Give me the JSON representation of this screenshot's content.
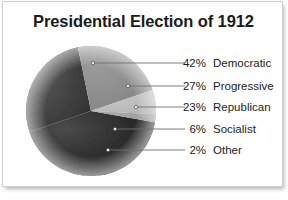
{
  "chart_data": {
    "type": "pie",
    "title": "Presidential Election of 1912",
    "categories": [
      "Democratic",
      "Progressive",
      "Republican",
      "Socialist",
      "Other"
    ],
    "values": [
      42,
      27,
      23,
      6,
      2
    ],
    "value_unit": "%",
    "labels": [
      "42%",
      "27%",
      "23%",
      "6%",
      "2%"
    ],
    "colors": [
      "#2a2a2a",
      "#3f3f3f",
      "#8a8a8a",
      "#b9b9b9",
      "#9e9e9e"
    ],
    "legend_position": "right",
    "grid": false,
    "xlabel": "",
    "ylabel": ""
  },
  "header": {
    "title": "Presidential Election of 1912"
  },
  "legend": {
    "rows": [
      {
        "pct": "42%",
        "name": "Democratic"
      },
      {
        "pct": "27%",
        "name": "Progressive"
      },
      {
        "pct": "23%",
        "name": "Republican"
      },
      {
        "pct": "6%",
        "name": "Socialist"
      },
      {
        "pct": "2%",
        "name": "Other"
      }
    ]
  }
}
